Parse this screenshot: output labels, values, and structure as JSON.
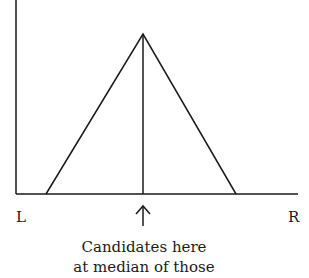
{
  "diagram": {
    "type": "unimodal voter distribution (triangular)",
    "axis_labels": {
      "left": "L",
      "right": "R"
    },
    "caption": {
      "line1": "Candidates here",
      "line2": "at median of those"
    },
    "shape": {
      "y_axis": {
        "x": 16,
        "y_top": 0,
        "y_bottom": 194
      },
      "x_axis": {
        "y": 194,
        "x_start": 16,
        "x_end": 298
      },
      "triangle": {
        "left_base_x": 46,
        "apex": [
          143,
          34
        ],
        "right_base_x": 236
      },
      "median_line_x": 143,
      "arrow": {
        "x": 143,
        "y_head": 206,
        "y_tail": 226
      }
    },
    "colors": {
      "line": "#1a1a1a",
      "background": "#ffffff"
    }
  }
}
